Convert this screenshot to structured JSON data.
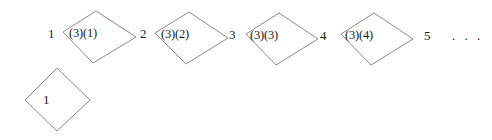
{
  "figure": {
    "background_color": "#ffffff",
    "line_color": "#8a8a8a",
    "text_color": "#1a1a1a",
    "width": 492,
    "height": 140,
    "sequence_numbers": [
      {
        "text": "1",
        "x": 48,
        "y": 27
      },
      {
        "text": "2",
        "x": 140,
        "y": 27
      },
      {
        "text": "3",
        "x": 229,
        "y": 28
      },
      {
        "text": "4",
        "x": 320,
        "y": 29
      },
      {
        "text": "5",
        "x": 424,
        "y": 29
      }
    ],
    "ellipsis": {
      "text": ". . .",
      "x": 452,
      "y": 29
    },
    "top_row_shapes": [
      {
        "label": "(3)(1)",
        "label_x": 69,
        "label_y": 27,
        "points": "63,32 96,11 136,37 93,63"
      },
      {
        "label": "(3)(2)",
        "label_x": 161,
        "label_y": 28,
        "points": "155,33 189,12 228,38 186,64"
      },
      {
        "label": "(3)(3)",
        "label_x": 250,
        "label_y": 29,
        "points": "246,34 279,13 318,39 276,65"
      },
      {
        "label": "(3)(4)",
        "label_x": 345,
        "label_y": 29,
        "points": "341,34 374,13 413,39 371,65"
      }
    ],
    "bottom_shape": {
      "label": "1",
      "label_x": 43,
      "label_y": 93,
      "points": "25,100 57,68 90,100 57,131"
    }
  }
}
